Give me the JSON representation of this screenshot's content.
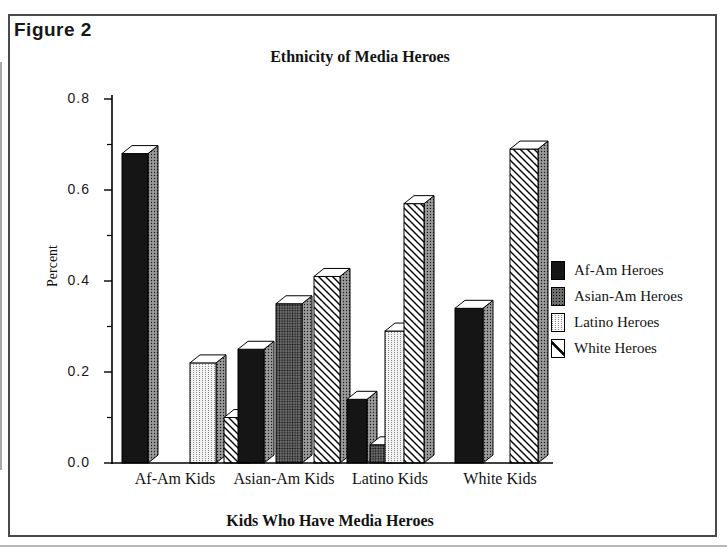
{
  "figure_label": "Figure 2",
  "chart_data": {
    "type": "bar",
    "projection": "3d-oblique-columns",
    "title": "Ethnicity of Media Heroes",
    "xlabel": "Kids Who Have Media Heroes",
    "ylabel": "Percent",
    "ylim": [
      0.0,
      0.8
    ],
    "y_major_ticks": [
      0.0,
      0.2,
      0.4,
      0.6,
      0.8
    ],
    "y_tick_labels": [
      "0.0",
      "0.2",
      "0.4",
      "0.6",
      "0.8"
    ],
    "y_minor_ticks": [
      0.1,
      0.3,
      0.5,
      0.7
    ],
    "grid": false,
    "legend_position": "right",
    "categories": [
      "Af-Am Kids",
      "Asian-Am Kids",
      "Latino Kids",
      "White Kids"
    ],
    "series": [
      {
        "name": "Af-Am Heroes",
        "pattern": "solid-black",
        "values": [
          0.68,
          0.25,
          0.14,
          0.34
        ]
      },
      {
        "name": "Asian-Am Heroes",
        "pattern": "dark-dot-texture",
        "values": [
          0.0,
          0.35,
          0.04,
          0.0
        ]
      },
      {
        "name": "Latino Heroes",
        "pattern": "light-dotted-columns",
        "values": [
          0.22,
          0.0,
          0.29,
          0.0
        ]
      },
      {
        "name": "White Heroes",
        "pattern": "diagonal-hatch",
        "values": [
          0.1,
          0.41,
          0.57,
          0.69
        ]
      }
    ],
    "colors": {
      "bar_black": "#151515",
      "side_face_gray": "#9a9a9a",
      "top_face": "#ffffff",
      "outline": "#000000",
      "frame_border": "#4a4a4a"
    }
  }
}
